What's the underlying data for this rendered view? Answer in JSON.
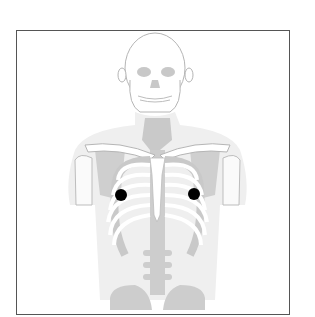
{
  "figure": {
    "colors": {
      "frame_border": "#555555",
      "bone_fill": "#ffffff",
      "bone_outline": "#b0b0b0",
      "soft_tissue": "#ececec",
      "shadow_gray": "#c8c8c8",
      "marker": "#000000"
    },
    "markers": [
      {
        "name": "right-chest-marker",
        "cx": 121,
        "cy": 195,
        "r": 6
      },
      {
        "name": "left-chest-marker",
        "cx": 194,
        "cy": 194,
        "r": 6
      }
    ]
  }
}
